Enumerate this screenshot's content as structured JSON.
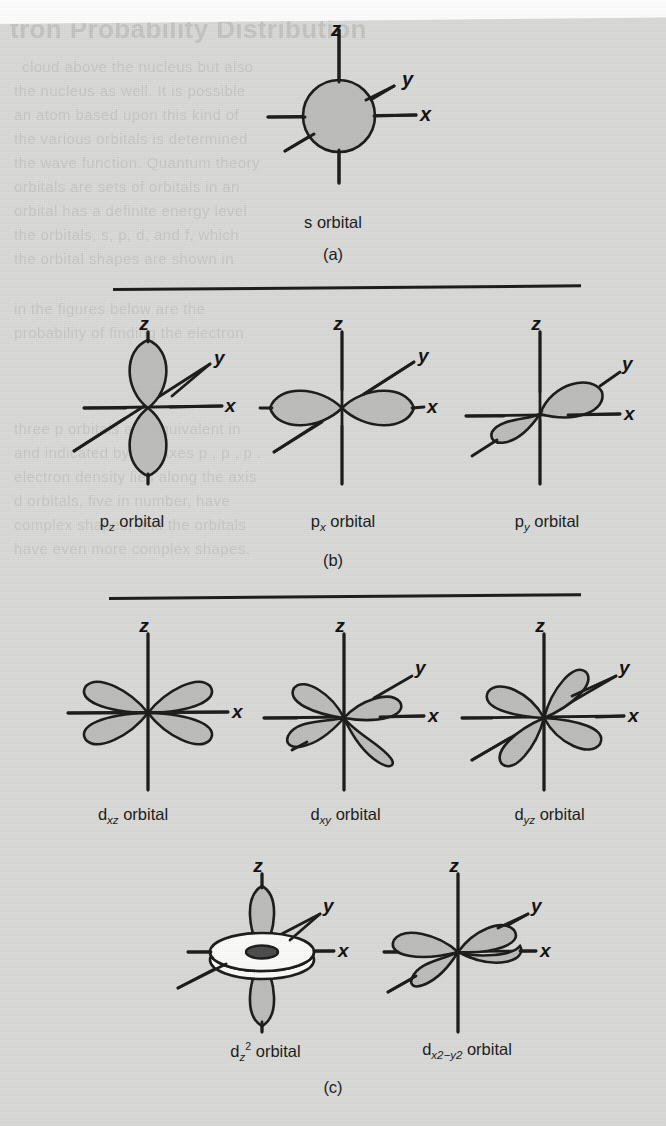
{
  "figure": {
    "kind": "atomic-orbital-shapes-figure",
    "background_color": "#d9d9d7",
    "ink_color": "#1b1b1b",
    "lobe_fill_color": "#bdbdbb",
    "axis_labels": {
      "x": "x",
      "y": "y",
      "z": "z"
    }
  },
  "ghost_text": {
    "heading": "tron Probability Distribution",
    "lines": [
      "cloud above the nucleus but also",
      "the nucleus as well. It is possible",
      "an atom based upon this kind of",
      "the various orbitals is determined",
      "the wave function. Quantum theory",
      "orbitals are sets of orbitals in an",
      "orbital has a definite energy level",
      "the orbitals, s, p, d, and f, which",
      "the orbital shapes are shown in",
      "in the figures below are the",
      "probability of finding the electron",
      "three p orbitals are equivalent in",
      "and indicated by the axes p , p , p .",
      "electron density lies along the axis",
      "d orbitals, five in number, have",
      "complex shapes, and the orbitals",
      "have even more complex shapes."
    ]
  },
  "panels": [
    {
      "id": "a",
      "label": "(a)",
      "items": [
        {
          "name": "s-orbital",
          "caption_prefix": "s",
          "caption_suffix": " orbital",
          "axes_shown": [
            "z",
            "y",
            "x"
          ],
          "shape": "sphere"
        }
      ]
    },
    {
      "id": "b",
      "label": "(b)",
      "items": [
        {
          "name": "pz-orbital",
          "caption_prefix": "p",
          "caption_sub": "z",
          "caption_suffix": " orbital",
          "axes_shown": [
            "z",
            "y",
            "x"
          ],
          "shape": "two-lobes-vertical"
        },
        {
          "name": "px-orbital",
          "caption_prefix": "p",
          "caption_sub": "x",
          "caption_suffix": " orbital",
          "axes_shown": [
            "z",
            "y",
            "x"
          ],
          "shape": "two-lobes-horizontal"
        },
        {
          "name": "py-orbital",
          "caption_prefix": "p",
          "caption_sub": "y",
          "caption_suffix": " orbital",
          "axes_shown": [
            "z",
            "y",
            "x"
          ],
          "shape": "two-lobes-diagonal"
        }
      ]
    },
    {
      "id": "c",
      "label": "(c)",
      "items": [
        {
          "name": "dxz-orbital",
          "caption_prefix": "d",
          "caption_sub": "xz",
          "caption_suffix": " orbital",
          "axes_shown": [
            "z",
            "x"
          ],
          "shape": "four-lobes-cloverleaf"
        },
        {
          "name": "dxy-orbital",
          "caption_prefix": "d",
          "caption_sub": "xy",
          "caption_suffix": " orbital",
          "axes_shown": [
            "z",
            "y",
            "x"
          ],
          "shape": "four-lobes-skewed"
        },
        {
          "name": "dyz-orbital",
          "caption_prefix": "d",
          "caption_sub": "yz",
          "caption_suffix": " orbital",
          "axes_shown": [
            "z",
            "y",
            "x"
          ],
          "shape": "four-lobes-tilted"
        },
        {
          "name": "dz2-orbital",
          "caption_prefix": "d",
          "caption_sub": "z",
          "caption_sub_sup": "2",
          "caption_suffix": " orbital",
          "axes_shown": [
            "z",
            "y",
            "x"
          ],
          "shape": "two-lobes-with-torus"
        },
        {
          "name": "dx2-y2-orbital",
          "caption_prefix": "d",
          "caption_sub_a": "x",
          "caption_sup_a": "2",
          "caption_minus": "−",
          "caption_sub_b": "y",
          "caption_sup_b": "2",
          "caption_suffix": " orbital",
          "axes_shown": [
            "z",
            "y",
            "x"
          ],
          "shape": "four-lobes-horizontal"
        }
      ]
    }
  ],
  "dividers": [
    {
      "name": "divider-a-b",
      "y": 289
    },
    {
      "name": "divider-b-c",
      "y": 598
    }
  ]
}
